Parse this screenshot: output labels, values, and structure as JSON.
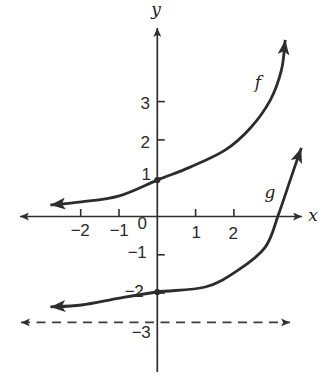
{
  "figure": {
    "corner_fragment": ")",
    "background": "#ffffff",
    "ink_color": "#2e2e2e"
  },
  "chart_data": {
    "type": "line",
    "title": "",
    "xlabel": "x",
    "ylabel": "y",
    "xlim": [
      -3.6,
      4.3
    ],
    "ylim": [
      -4.2,
      5.0
    ],
    "grid": false,
    "origin_label": "0",
    "x_ticks": [
      {
        "value": -2,
        "label": "−2",
        "has_tick": true
      },
      {
        "value": -1,
        "label": "−1",
        "has_tick": true
      },
      {
        "value": 0,
        "label": "0",
        "has_tick": false
      },
      {
        "value": 1,
        "label": "1",
        "has_tick": true
      },
      {
        "value": 2,
        "label": "2",
        "has_tick": true
      }
    ],
    "y_ticks": [
      {
        "value": 3,
        "label": "3",
        "has_tick": true
      },
      {
        "value": 2,
        "label": "2",
        "has_tick": true
      },
      {
        "value": 1,
        "label": "1",
        "has_tick": true
      },
      {
        "value": -1,
        "label": "−1",
        "has_tick": true
      },
      {
        "value": -2,
        "label": "−2",
        "has_tick": true
      },
      {
        "value": -3,
        "label": "−3",
        "has_tick": false
      }
    ],
    "series": [
      {
        "name": "f",
        "label": "f",
        "shape": "increasing exponential curve",
        "y_intercept": 1,
        "horizontal_asymptote": 0,
        "points": [
          [
            -2.79,
            0.3
          ],
          [
            -1.98,
            0.38
          ],
          [
            -0.99,
            0.54
          ],
          [
            0,
            0.95
          ],
          [
            0.86,
            1.29
          ],
          [
            1.78,
            1.74
          ],
          [
            2.43,
            2.31
          ],
          [
            2.95,
            3.04
          ],
          [
            3.24,
            3.82
          ],
          [
            3.34,
            4.61
          ]
        ]
      },
      {
        "name": "g",
        "label": "g",
        "shape": "increasing exponential curve (f shifted down 3)",
        "y_intercept": -2,
        "horizontal_asymptote": -3,
        "points": [
          [
            -2.79,
            -2.36
          ],
          [
            -1.98,
            -2.31
          ],
          [
            -0.99,
            -2.13
          ],
          [
            0,
            -1.97
          ],
          [
            1.25,
            -1.84
          ],
          [
            2.11,
            -1.4
          ],
          [
            2.82,
            -0.8
          ],
          [
            3.16,
            0.04
          ],
          [
            3.47,
            0.95
          ],
          [
            3.76,
            1.79
          ]
        ]
      }
    ],
    "asymptote": {
      "y": -3,
      "style": "dashed",
      "arrows": "both-ends"
    },
    "intercept_dots": [
      [
        0,
        0.95
      ],
      [
        0,
        -1.97
      ]
    ]
  }
}
